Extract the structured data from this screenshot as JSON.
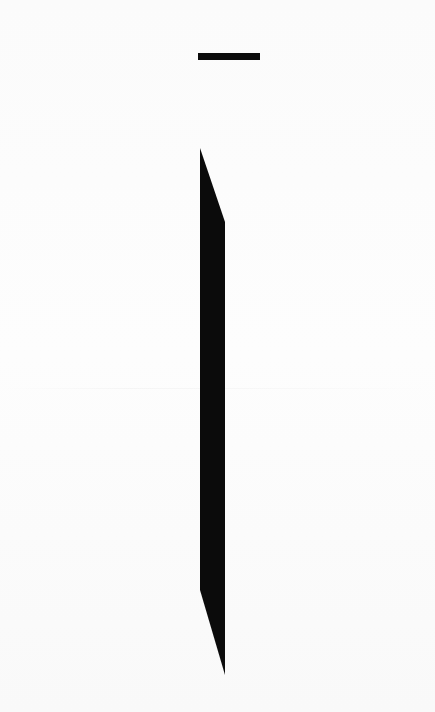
{
  "scene": {
    "background_color": "#fdfdfd",
    "shape_color": "#0b0b0b",
    "top_bar": {
      "x": 198,
      "y": 53,
      "width": 62,
      "height": 7
    },
    "blade_polygon": [
      [
        200,
        148
      ],
      [
        225,
        222
      ],
      [
        225,
        675
      ],
      [
        200,
        590
      ]
    ]
  }
}
